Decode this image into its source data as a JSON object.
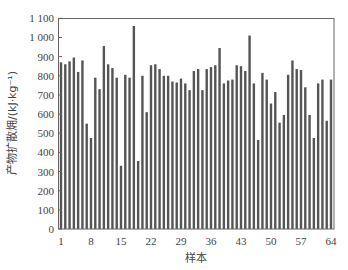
{
  "chart_data": {
    "type": "bar",
    "title": "",
    "xlabel": "样本",
    "ylabel": "产物扩散㶲/(kJ·kg⁻¹)",
    "ylim": [
      0,
      1100
    ],
    "yticks": [
      0,
      100,
      200,
      300,
      400,
      500,
      600,
      700,
      800,
      900,
      1000,
      1100
    ],
    "ytick_labels": [
      "0",
      "100",
      "200",
      "300",
      "400",
      "500",
      "600",
      "700",
      "800",
      "900",
      "1 000",
      "1 100"
    ],
    "xticks": [
      1,
      8,
      15,
      22,
      29,
      36,
      43,
      50,
      57,
      64
    ],
    "grid": false,
    "legend": null,
    "bar_color": "#555555",
    "categories": [
      1,
      2,
      3,
      4,
      5,
      6,
      7,
      8,
      9,
      10,
      11,
      12,
      13,
      14,
      15,
      16,
      17,
      18,
      19,
      20,
      21,
      22,
      23,
      24,
      25,
      26,
      27,
      28,
      29,
      30,
      31,
      32,
      33,
      34,
      35,
      36,
      37,
      38,
      39,
      40,
      41,
      42,
      43,
      44,
      45,
      46,
      47,
      48,
      49,
      50,
      51,
      52,
      53,
      54,
      55,
      56,
      57,
      58,
      59,
      60,
      61,
      62,
      63,
      64
    ],
    "values": [
      870,
      860,
      875,
      895,
      820,
      880,
      550,
      475,
      790,
      730,
      955,
      860,
      840,
      790,
      330,
      805,
      790,
      1060,
      355,
      800,
      610,
      855,
      860,
      835,
      800,
      800,
      770,
      765,
      785,
      760,
      725,
      825,
      835,
      725,
      835,
      845,
      855,
      945,
      760,
      775,
      780,
      855,
      850,
      825,
      1010,
      760,
      465,
      815,
      780,
      655,
      715,
      555,
      595,
      805,
      880,
      835,
      830,
      740,
      595,
      475,
      760,
      780,
      565,
      780
    ]
  }
}
